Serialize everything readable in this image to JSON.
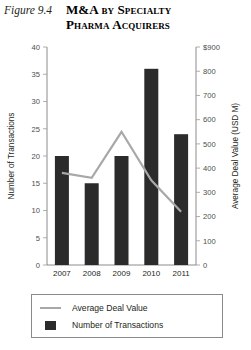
{
  "figure": {
    "number_label": "Figure 9.4",
    "title_line_1": "M&A by Specialty",
    "title_line_2": "Pharma Acquirers"
  },
  "legend": {
    "items": [
      {
        "label": "Average Deal Value",
        "marker": "line",
        "color": "#a8a8a8"
      },
      {
        "label": "Number of Transactions",
        "marker": "square",
        "color": "#2b2b2b"
      }
    ]
  },
  "colors": {
    "bar": "#2b2b2b",
    "line": "#a8a8a8",
    "axis": "#6f6f6f",
    "text": "#231f20"
  },
  "chart_data": {
    "type": "bar",
    "title": "M&A by Specialty Pharma Acquirers",
    "subtitle": "Figure 9.4",
    "categories": [
      "2007",
      "2008",
      "2009",
      "2010",
      "2011"
    ],
    "xlabel": "",
    "ylabel": "Number of Transactions",
    "ylim": [
      0,
      40
    ],
    "yticks": [
      "0",
      "5",
      "10",
      "15",
      "20",
      "25",
      "30",
      "35",
      "40"
    ],
    "y2label": "Average Deal Value (USD M)",
    "y2lim": [
      0,
      900
    ],
    "y2ticks": [
      "0",
      "100",
      "200",
      "300",
      "400",
      "500",
      "600",
      "700",
      "800",
      "$900"
    ],
    "grid": false,
    "legend_position": "bottom",
    "series": [
      {
        "name": "Number of Transactions",
        "type": "bar",
        "axis": "left",
        "values": [
          20,
          15,
          20,
          36,
          24
        ]
      },
      {
        "name": "Average Deal Value",
        "type": "line",
        "axis": "right",
        "values": [
          380,
          360,
          550,
          350,
          220
        ]
      }
    ]
  }
}
